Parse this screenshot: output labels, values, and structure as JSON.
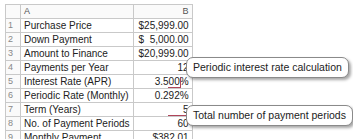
{
  "sheet": {
    "columns": [
      "A",
      "B"
    ],
    "rows": [
      {
        "num": "1",
        "label": "Purchase Price",
        "value": "$25,999.00"
      },
      {
        "num": "2",
        "label": "Down Payment",
        "value": "$  5,000.00"
      },
      {
        "num": "3",
        "label": "Amount to Finance",
        "value": "$20,999.00"
      },
      {
        "num": "4",
        "label": "Payments per Year",
        "value": "12"
      },
      {
        "num": "5",
        "label": "Interest Rate (APR)",
        "value": "3.500%"
      },
      {
        "num": "6",
        "label": "Periodic Rate (Monthly)",
        "value": "0.292%"
      },
      {
        "num": "7",
        "label": "Term (Years)",
        "value": "5"
      },
      {
        "num": "8",
        "label": "No. of Payment Periods",
        "value": "60"
      },
      {
        "num": "9",
        "label": "Monthly Payment",
        "value": "$382.01"
      }
    ]
  },
  "callouts": {
    "periodic_rate": "Periodic interest rate calculation",
    "payment_periods": "Total number of payment periods"
  },
  "colors": {
    "connector": "#b0455a",
    "grid": "#c9c9c9"
  }
}
